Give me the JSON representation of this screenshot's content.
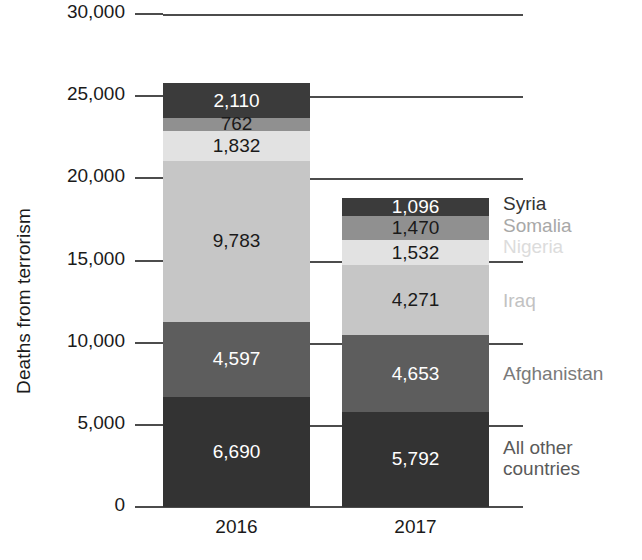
{
  "chart_data": {
    "type": "bar",
    "subtype": "stacked-bar",
    "title": "",
    "xlabel": "",
    "ylabel": "Deaths from terrorism",
    "categories": [
      "2016",
      "2017"
    ],
    "ylim": [
      0,
      30000
    ],
    "yticks": [
      0,
      5000,
      10000,
      15000,
      20000,
      25000,
      30000
    ],
    "ytick_labels": [
      "0",
      "5,000",
      "10,000",
      "15,000",
      "20,000",
      "25,000",
      "30,000"
    ],
    "grid": true,
    "legend_position": "right",
    "stack_order_top_to_bottom": [
      "Syria",
      "Somalia",
      "Nigeria",
      "Iraq",
      "Afghanistan",
      "All other countries"
    ],
    "series": [
      {
        "name": "Syria",
        "values": [
          2110,
          1096
        ],
        "value_labels": [
          "2,110",
          "1,096"
        ],
        "color": "#3b3b3b",
        "label_color": "#ffffff",
        "legend_color": "#333333"
      },
      {
        "name": "Somalia",
        "values": [
          762,
          1470
        ],
        "value_labels": [
          "762",
          "1,470"
        ],
        "color": "#909090",
        "label_color": "#1a1a1a",
        "legend_color": "#a8a8a8"
      },
      {
        "name": "Nigeria",
        "values": [
          1832,
          1532
        ],
        "value_labels": [
          "1,832",
          "1,532"
        ],
        "color": "#e2e2e2",
        "label_color": "#1a1a1a",
        "legend_color": "#dcdcdc"
      },
      {
        "name": "Iraq",
        "values": [
          9783,
          4271
        ],
        "value_labels": [
          "9,783",
          "4,271"
        ],
        "color": "#c6c6c6",
        "label_color": "#1a1a1a",
        "legend_color": "#c2c2c2"
      },
      {
        "name": "Afghanistan",
        "values": [
          4597,
          4653
        ],
        "value_labels": [
          "4,597",
          "4,653"
        ],
        "color": "#5d5d5d",
        "label_color": "#ffffff",
        "legend_color": "#7a7a7a"
      },
      {
        "name": "All other\ncountries",
        "values": [
          6690,
          5792
        ],
        "value_labels": [
          "6,690",
          "5,792"
        ],
        "color": "#333333",
        "label_color": "#ffffff",
        "legend_color": "#5a5a5a"
      }
    ],
    "totals": [
      25774,
      18814
    ]
  },
  "axis": {
    "y_title": "Deaths from terrorism"
  },
  "legend": {
    "items": [
      {
        "label": "Syria",
        "top": 193
      },
      {
        "label": "Somalia",
        "top": 215
      },
      {
        "label": "Nigeria",
        "top": 236
      },
      {
        "label": "Iraq",
        "top": 290
      },
      {
        "label": "Afghanistan",
        "top": 363
      },
      {
        "label": "All other\ncountries",
        "top": 437
      }
    ]
  }
}
